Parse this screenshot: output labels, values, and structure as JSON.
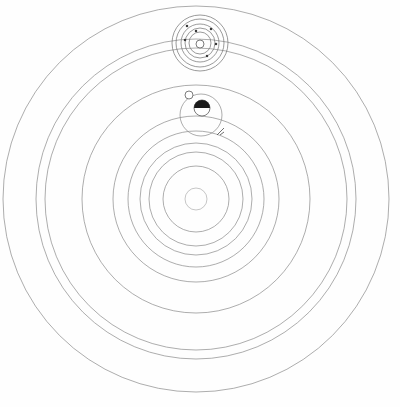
{
  "diagram": {
    "type": "concentric-orbs",
    "canvas": {
      "width": 400,
      "height": 407,
      "background": "#fefefe"
    },
    "center": {
      "x": 196,
      "y": 199,
      "label": "O"
    },
    "stroke_color": "#8a8a8a",
    "label_color": "#3a3a3a",
    "orbs": [
      {
        "id": "orb-center",
        "label": "O",
        "radius": 11,
        "label_x": 216,
        "label_y": 200,
        "label_side": "right"
      },
      {
        "id": "orb-b",
        "label": "B",
        "radius": 33,
        "label_x": 199,
        "label_y": 175,
        "label_side": "top"
      },
      {
        "id": "orb-g",
        "label": "G",
        "radius": 47,
        "label_x": 200,
        "label_y": 245,
        "label_side": "bottom"
      },
      {
        "id": "orb-c",
        "label": "C",
        "radius": 56,
        "label_x": 197,
        "label_y": 145,
        "label_side": "top"
      },
      {
        "id": "orb-h",
        "label": "H",
        "radius": 68,
        "label_x": 201,
        "label_y": 267,
        "label_side": "bottom"
      },
      {
        "id": "orb-d",
        "label": "D",
        "radius": 83,
        "label_x": 200,
        "label_y": 78,
        "label_side": "top"
      },
      {
        "id": "orb-i",
        "label": "I",
        "radius": 114,
        "label_x": 200,
        "label_y": 323,
        "label_side": "bottom"
      },
      {
        "id": "orb-f",
        "label": "F",
        "radius": 151,
        "label_x": 202,
        "label_y": 10,
        "label_side": "top"
      },
      {
        "id": "orb-l",
        "label": "L",
        "radius": 160,
        "label_x": 201,
        "label_y": 356,
        "label_side": "bottom"
      },
      {
        "id": "orb-m",
        "label": "M",
        "radius": 193,
        "label_x": 201,
        "label_y": 389,
        "label_side": "bottom"
      }
    ],
    "markers": [
      {
        "id": "marker-a",
        "label": "A",
        "x": 202,
        "y": 108,
        "label_x": 203,
        "label_y": 126,
        "kind": "half-shaded-body",
        "radius": 8
      },
      {
        "id": "marker-e",
        "label": "E",
        "x": 200,
        "y": 44,
        "label_x": 201,
        "label_y": 50,
        "kind": "open-body",
        "radius": 4
      },
      {
        "id": "marker-n",
        "label": "N",
        "x": 189,
        "y": 95,
        "label_x": 189,
        "label_y": 104,
        "kind": "node-circle",
        "radius": 4
      },
      {
        "id": "marker-p",
        "label": "P",
        "x": 221,
        "y": 131,
        "label_x": 230,
        "label_y": 133,
        "kind": "node-tick"
      }
    ],
    "epicycle": {
      "id": "epicycle-e",
      "center": {
        "x": 200,
        "y": 43
      },
      "rings": [
        28,
        24,
        19,
        15,
        11
      ],
      "dots": [
        {
          "x": 187,
          "y": 26
        },
        {
          "x": 211,
          "y": 29
        },
        {
          "x": 216,
          "y": 44
        },
        {
          "x": 196,
          "y": 31
        },
        {
          "x": 185,
          "y": 40
        },
        {
          "x": 207,
          "y": 56
        }
      ]
    },
    "deferent": {
      "id": "deferent-a",
      "center": {
        "x": 201,
        "y": 115
      },
      "radius": 21
    }
  }
}
